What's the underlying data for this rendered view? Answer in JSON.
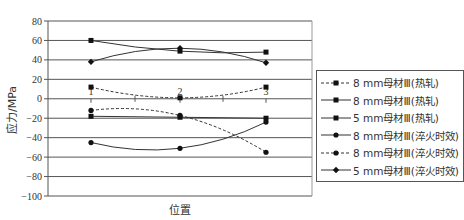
{
  "chart_data": {
    "type": "line",
    "title": "",
    "xlabel": "位置",
    "ylabel": "应力/MPa",
    "categories": [
      "1",
      "2",
      "3"
    ],
    "ylim": [
      -100,
      80
    ],
    "yticks": [
      80,
      60,
      40,
      20,
      0,
      -20,
      -40,
      -60,
      -80,
      -100
    ],
    "grid": true,
    "legend_position": "right",
    "series": [
      {
        "name": "8 mm母材Ⅲ(热轧)",
        "marker": "square",
        "line": "dashed",
        "values": [
          12,
          1,
          12
        ]
      },
      {
        "name": "8 mm母材Ⅲ(热轧)",
        "marker": "square",
        "line": "solid",
        "values": [
          60,
          49,
          48
        ]
      },
      {
        "name": "5 mm母材Ⅲ(热轧)",
        "marker": "square",
        "line": "solid",
        "values": [
          -18,
          -19,
          -20
        ]
      },
      {
        "name": "8 mm母材Ⅲ(淬火时效)",
        "marker": "circle",
        "line": "solid",
        "values": [
          -45,
          -51,
          -24
        ]
      },
      {
        "name": "8 mm母材Ⅲ(淬火时效)",
        "marker": "circle",
        "line": "dashed",
        "values": [
          -12,
          -17,
          -55
        ]
      },
      {
        "name": "5 mm母材Ⅲ(淬火时效)",
        "marker": "diamond",
        "line": "solid",
        "values": [
          38,
          52,
          37
        ]
      }
    ]
  }
}
